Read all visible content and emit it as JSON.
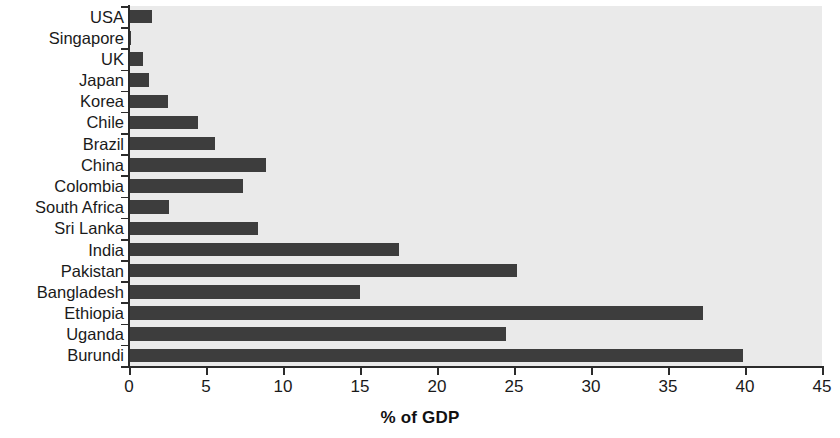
{
  "chart_data": {
    "type": "bar",
    "orientation": "horizontal",
    "title": "",
    "xlabel": "% of GDP",
    "ylabel": "",
    "xlim": [
      0,
      45
    ],
    "xticks": [
      0,
      5,
      10,
      15,
      20,
      25,
      30,
      35,
      40,
      45
    ],
    "grid": false,
    "legend": null,
    "categories": [
      "USA",
      "Singapore",
      "UK",
      "Japan",
      "Korea",
      "Chile",
      "Brazil",
      "China",
      "Colombia",
      "South Africa",
      "Sri Lanka",
      "India",
      "Pakistan",
      "Bangladesh",
      "Ethiopia",
      "Uganda",
      "Burundi"
    ],
    "values": [
      1.5,
      0.1,
      0.9,
      1.3,
      2.5,
      4.5,
      5.6,
      8.9,
      7.4,
      2.6,
      8.4,
      17.5,
      25.2,
      15.0,
      37.3,
      24.5,
      39.9
    ]
  },
  "style": {
    "bar_color": "#3d3d3d",
    "plot_background": "#eaeaea",
    "figure_background": "#ffffff",
    "axis_color": "#2b2b2b",
    "text_color": "#1a1a1a"
  }
}
